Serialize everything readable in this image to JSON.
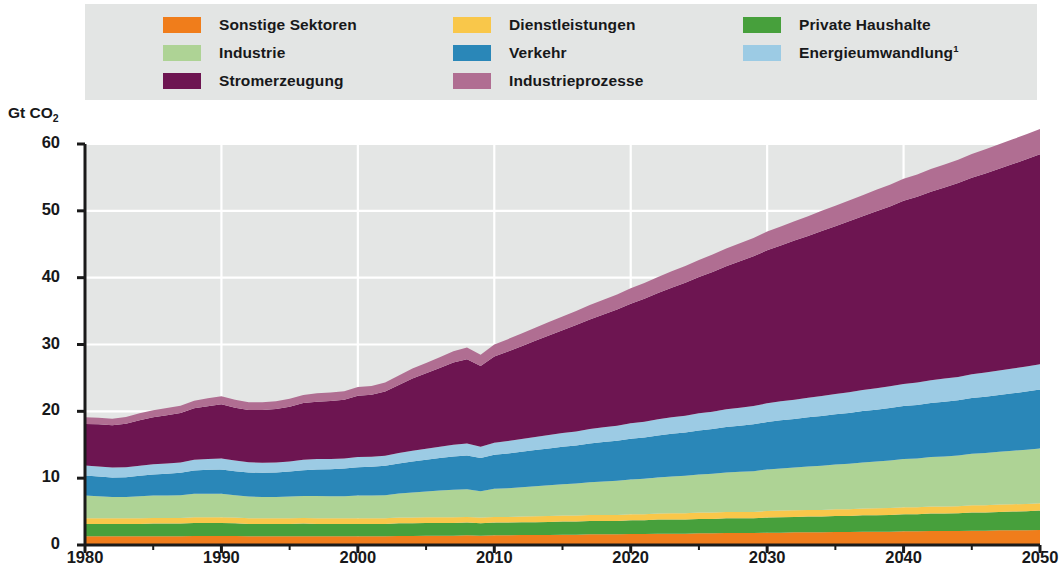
{
  "legend": {
    "items": [
      {
        "label": "Sonstige Sektoren",
        "color": "#f07d1b",
        "key": "sonstige",
        "col": 0,
        "row": 0
      },
      {
        "label": "Dienstleistungen",
        "color": "#f8c council",
        "key": "dienstleistungen",
        "col": 1,
        "row": 0
      },
      {
        "label": "Private Haushalte",
        "color": "#47a03c",
        "key": "haushalte",
        "col": 2,
        "row": 0
      },
      {
        "label": "Industrie",
        "color": "#aed395",
        "key": "industrie",
        "col": 0,
        "row": 1
      },
      {
        "label": "Verkehr",
        "color": "#2a87b8",
        "key": "verkehr",
        "col": 1,
        "row": 1
      },
      {
        "label": "Energieumwandlung",
        "color": "#9ccbe4",
        "key": "energie",
        "col": 2,
        "row": 1,
        "sup": "1"
      },
      {
        "label": "Stromerzeugung",
        "color": "#6d1551",
        "key": "strom",
        "col": 0,
        "row": 2
      },
      {
        "label": "Industrieprozesse",
        "color": "#b06e92",
        "key": "prozesse",
        "col": 1,
        "row": 2
      }
    ]
  },
  "axes": {
    "y_label_text": "Gt CO",
    "y_label_sub": "2",
    "y_ticks": [
      0,
      10,
      20,
      30,
      40,
      50,
      60
    ],
    "x_ticks": [
      1980,
      1990,
      2000,
      2010,
      2020,
      2030,
      2040,
      2050
    ]
  },
  "chart_data": {
    "type": "area",
    "title": "",
    "xlabel": "",
    "ylabel": "Gt CO2",
    "xlim": [
      1980,
      2050
    ],
    "ylim": [
      0,
      60
    ],
    "grid": true,
    "legend_position": "top",
    "stacked": true,
    "x": [
      1980,
      1981,
      1982,
      1983,
      1984,
      1985,
      1986,
      1987,
      1988,
      1989,
      1990,
      1991,
      1992,
      1993,
      1994,
      1995,
      1996,
      1997,
      1998,
      1999,
      2000,
      2001,
      2002,
      2003,
      2004,
      2005,
      2006,
      2007,
      2008,
      2009,
      2010,
      2011,
      2012,
      2013,
      2014,
      2015,
      2016,
      2017,
      2018,
      2019,
      2020,
      2021,
      2022,
      2023,
      2024,
      2025,
      2026,
      2027,
      2028,
      2029,
      2030,
      2031,
      2032,
      2033,
      2034,
      2035,
      2036,
      2037,
      2038,
      2039,
      2040,
      2041,
      2042,
      2043,
      2044,
      2045,
      2046,
      2047,
      2048,
      2049,
      2050
    ],
    "series": [
      {
        "name": "Sonstige Sektoren",
        "color": "#f07d1b",
        "values": [
          1.3,
          1.3,
          1.3,
          1.3,
          1.3,
          1.3,
          1.3,
          1.3,
          1.35,
          1.35,
          1.35,
          1.35,
          1.3,
          1.3,
          1.3,
          1.3,
          1.3,
          1.3,
          1.3,
          1.3,
          1.3,
          1.3,
          1.3,
          1.35,
          1.35,
          1.4,
          1.4,
          1.4,
          1.45,
          1.4,
          1.45,
          1.45,
          1.5,
          1.5,
          1.5,
          1.55,
          1.55,
          1.6,
          1.6,
          1.6,
          1.65,
          1.65,
          1.7,
          1.7,
          1.7,
          1.75,
          1.75,
          1.8,
          1.8,
          1.8,
          1.85,
          1.85,
          1.9,
          1.9,
          1.9,
          1.95,
          1.95,
          2.0,
          2.0,
          2.0,
          2.05,
          2.05,
          2.1,
          2.1,
          2.1,
          2.15,
          2.15,
          2.2,
          2.2,
          2.2,
          2.25
        ]
      },
      {
        "name": "Private Haushalte",
        "color": "#47a03c",
        "values": [
          1.85,
          1.85,
          1.85,
          1.85,
          1.85,
          1.9,
          1.9,
          1.9,
          1.95,
          1.95,
          1.95,
          1.9,
          1.85,
          1.85,
          1.85,
          1.85,
          1.9,
          1.85,
          1.85,
          1.85,
          1.85,
          1.85,
          1.85,
          1.9,
          1.9,
          1.9,
          1.9,
          1.9,
          1.9,
          1.85,
          1.9,
          1.9,
          1.9,
          1.9,
          1.95,
          1.95,
          1.95,
          2.0,
          2.0,
          2.0,
          2.05,
          2.05,
          2.1,
          2.1,
          2.1,
          2.15,
          2.15,
          2.2,
          2.2,
          2.2,
          2.25,
          2.3,
          2.3,
          2.35,
          2.35,
          2.4,
          2.4,
          2.45,
          2.45,
          2.5,
          2.55,
          2.55,
          2.6,
          2.6,
          2.65,
          2.7,
          2.7,
          2.75,
          2.8,
          2.85,
          2.9
        ]
      },
      {
        "name": "Dienstleistungen",
        "color": "#f9c74a",
        "values": [
          0.85,
          0.85,
          0.85,
          0.85,
          0.85,
          0.85,
          0.85,
          0.85,
          0.85,
          0.85,
          0.85,
          0.85,
          0.85,
          0.85,
          0.85,
          0.85,
          0.85,
          0.85,
          0.85,
          0.85,
          0.85,
          0.85,
          0.85,
          0.85,
          0.85,
          0.85,
          0.85,
          0.85,
          0.85,
          0.85,
          0.85,
          0.85,
          0.85,
          0.9,
          0.9,
          0.9,
          0.9,
          0.9,
          0.9,
          0.9,
          0.9,
          0.9,
          0.9,
          0.95,
          0.95,
          0.95,
          0.95,
          0.95,
          0.95,
          0.95,
          1.0,
          1.0,
          1.0,
          1.0,
          1.0,
          1.0,
          1.0,
          1.0,
          1.05,
          1.05,
          1.05,
          1.05,
          1.05,
          1.05,
          1.05,
          1.1,
          1.1,
          1.1,
          1.1,
          1.1,
          1.1
        ]
      },
      {
        "name": "Industrie",
        "color": "#aed395",
        "values": [
          3.4,
          3.3,
          3.2,
          3.2,
          3.3,
          3.35,
          3.35,
          3.4,
          3.5,
          3.5,
          3.5,
          3.35,
          3.25,
          3.2,
          3.2,
          3.25,
          3.3,
          3.35,
          3.3,
          3.3,
          3.4,
          3.4,
          3.45,
          3.6,
          3.75,
          3.85,
          4.0,
          4.1,
          4.15,
          3.95,
          4.2,
          4.3,
          4.4,
          4.5,
          4.6,
          4.7,
          4.8,
          4.9,
          5.0,
          5.1,
          5.2,
          5.3,
          5.4,
          5.5,
          5.6,
          5.7,
          5.8,
          5.9,
          6.0,
          6.1,
          6.2,
          6.3,
          6.4,
          6.5,
          6.6,
          6.7,
          6.8,
          6.9,
          7.0,
          7.1,
          7.2,
          7.3,
          7.4,
          7.5,
          7.6,
          7.7,
          7.8,
          7.9,
          8.0,
          8.1,
          8.2
        ]
      },
      {
        "name": "Verkehr",
        "color": "#2a87b8",
        "values": [
          3.0,
          2.95,
          2.9,
          2.95,
          3.05,
          3.15,
          3.25,
          3.35,
          3.5,
          3.6,
          3.65,
          3.6,
          3.6,
          3.6,
          3.65,
          3.75,
          3.85,
          3.95,
          4.05,
          4.15,
          4.25,
          4.3,
          4.4,
          4.5,
          4.65,
          4.75,
          4.85,
          5.0,
          5.05,
          4.95,
          5.1,
          5.2,
          5.3,
          5.4,
          5.5,
          5.6,
          5.7,
          5.8,
          5.9,
          6.0,
          6.1,
          6.2,
          6.3,
          6.4,
          6.5,
          6.6,
          6.7,
          6.8,
          6.9,
          7.0,
          7.1,
          7.2,
          7.25,
          7.35,
          7.45,
          7.5,
          7.6,
          7.7,
          7.75,
          7.85,
          7.95,
          8.0,
          8.1,
          8.2,
          8.25,
          8.35,
          8.45,
          8.5,
          8.6,
          8.7,
          8.8
        ]
      },
      {
        "name": "Energieumwandlung",
        "color": "#9ccbe4",
        "values": [
          1.5,
          1.5,
          1.5,
          1.5,
          1.5,
          1.55,
          1.55,
          1.55,
          1.6,
          1.6,
          1.65,
          1.6,
          1.55,
          1.5,
          1.5,
          1.5,
          1.55,
          1.55,
          1.5,
          1.5,
          1.5,
          1.5,
          1.5,
          1.55,
          1.6,
          1.65,
          1.7,
          1.75,
          1.8,
          1.7,
          1.8,
          1.85,
          1.9,
          1.95,
          2.0,
          2.05,
          2.1,
          2.15,
          2.2,
          2.25,
          2.3,
          2.35,
          2.4,
          2.45,
          2.5,
          2.55,
          2.6,
          2.65,
          2.7,
          2.75,
          2.8,
          2.85,
          2.9,
          2.95,
          3.0,
          3.05,
          3.1,
          3.15,
          3.2,
          3.25,
          3.3,
          3.35,
          3.4,
          3.45,
          3.5,
          3.55,
          3.6,
          3.65,
          3.7,
          3.75,
          3.8
        ]
      },
      {
        "name": "Stromerzeugung",
        "color": "#6d1551",
        "values": [
          6.2,
          6.3,
          6.3,
          6.5,
          6.8,
          7.0,
          7.2,
          7.4,
          7.7,
          7.9,
          8.1,
          7.9,
          7.8,
          7.9,
          8.0,
          8.2,
          8.5,
          8.6,
          8.7,
          8.8,
          9.2,
          9.3,
          9.6,
          10.2,
          10.8,
          11.3,
          11.8,
          12.3,
          12.6,
          12.1,
          12.9,
          13.4,
          13.9,
          14.4,
          14.9,
          15.4,
          15.9,
          16.4,
          16.9,
          17.4,
          17.9,
          18.4,
          18.9,
          19.4,
          19.9,
          20.4,
          20.9,
          21.4,
          21.9,
          22.4,
          22.9,
          23.3,
          23.8,
          24.2,
          24.7,
          25.1,
          25.6,
          26.0,
          26.5,
          26.9,
          27.4,
          27.8,
          28.2,
          28.6,
          29.0,
          29.4,
          29.8,
          30.2,
          30.6,
          31.0,
          31.4
        ]
      },
      {
        "name": "Industrieprozesse",
        "color": "#b06e92",
        "values": [
          1.0,
          1.0,
          1.0,
          1.0,
          1.05,
          1.05,
          1.1,
          1.1,
          1.15,
          1.2,
          1.2,
          1.2,
          1.15,
          1.15,
          1.15,
          1.2,
          1.2,
          1.25,
          1.25,
          1.25,
          1.3,
          1.3,
          1.35,
          1.4,
          1.5,
          1.55,
          1.6,
          1.7,
          1.75,
          1.65,
          1.8,
          1.85,
          1.9,
          1.95,
          2.0,
          2.05,
          2.1,
          2.15,
          2.2,
          2.25,
          2.3,
          2.35,
          2.4,
          2.45,
          2.5,
          2.55,
          2.6,
          2.65,
          2.7,
          2.75,
          2.8,
          2.85,
          2.9,
          2.95,
          3.0,
          3.05,
          3.1,
          3.15,
          3.2,
          3.25,
          3.3,
          3.35,
          3.4,
          3.45,
          3.5,
          3.55,
          3.6,
          3.65,
          3.7,
          3.75,
          3.8
        ]
      }
    ],
    "totals_reference": {
      "1980": 19.1,
      "1990": 22.25,
      "1992": 21.3,
      "2000": 24.65,
      "2008": 30.55,
      "2009": 29.45,
      "2010": 30.9,
      "2020": 37.95,
      "2030": 44.85,
      "2040": 51.85,
      "2050": 56.45
    }
  },
  "colors": {
    "legend_bg": "#e3e5e4",
    "plot_bg": "#e4e6e5",
    "grid": "#ffffff",
    "axis": "#1a1a1a"
  }
}
